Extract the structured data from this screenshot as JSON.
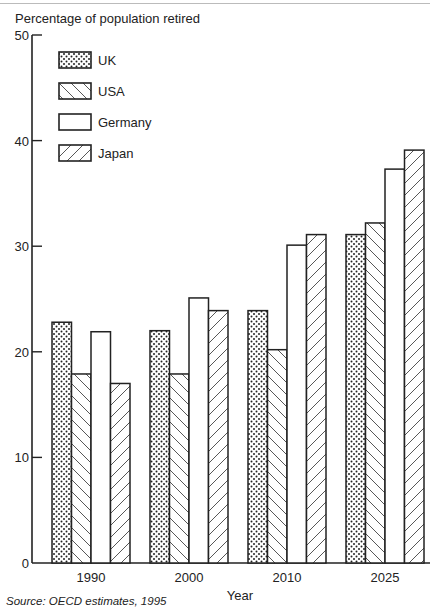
{
  "chart_data": {
    "type": "bar",
    "title": "",
    "ylabel": "Percentage of population retired",
    "xlabel": "Year",
    "ylim": [
      0,
      50
    ],
    "yticks": [
      0,
      10,
      20,
      30,
      40,
      50
    ],
    "grid": false,
    "legend_position": "top-left inside",
    "categories": [
      "1990",
      "2000",
      "2010",
      "2025"
    ],
    "series": [
      {
        "name": "UK",
        "pattern": "dots",
        "values": [
          22.8,
          22.0,
          23.9,
          31.1
        ]
      },
      {
        "name": "USA",
        "pattern": "back-diagonal",
        "values": [
          17.9,
          17.9,
          20.2,
          32.2
        ]
      },
      {
        "name": "Germany",
        "pattern": "none",
        "values": [
          21.9,
          25.1,
          30.1,
          37.3
        ]
      },
      {
        "name": "Japan",
        "pattern": "forward-diagonal",
        "values": [
          17.0,
          23.9,
          31.1,
          39.1
        ]
      }
    ],
    "annotations": [
      "Source: OECD estimates, 1995"
    ]
  },
  "labels": {
    "ytitle": "Percentage of population retired",
    "xtitle": "Year",
    "source": "Source: OECD estimates, 1995"
  },
  "colors": {
    "ink": "#222222",
    "background": "#ffffff"
  }
}
